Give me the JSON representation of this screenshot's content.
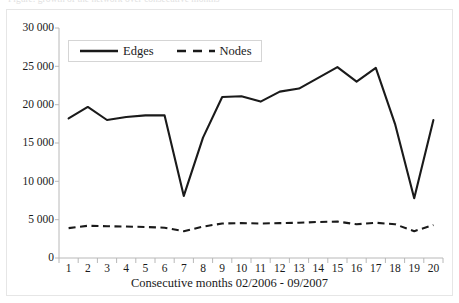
{
  "clipped_caption": "Figure: growth of the network over consecutive months",
  "chart_data": {
    "type": "line",
    "title": "",
    "subtitle": "",
    "xlabel": "Consecutive months 02/2006 - 09/2007",
    "ylabel": "",
    "categories": [
      "1",
      "2",
      "3",
      "4",
      "5",
      "6",
      "7",
      "8",
      "9",
      "10",
      "11",
      "12",
      "13",
      "14",
      "15",
      "16",
      "17",
      "18",
      "19",
      "20"
    ],
    "x": [
      1,
      2,
      3,
      4,
      5,
      6,
      7,
      8,
      9,
      10,
      11,
      12,
      13,
      14,
      15,
      16,
      17,
      18,
      19,
      20
    ],
    "xlim": [
      0.5,
      20.5
    ],
    "ylim": [
      0,
      30000
    ],
    "ytick_values": [
      0,
      5000,
      10000,
      15000,
      20000,
      25000,
      30000
    ],
    "ytick_labels": [
      "0",
      "5 000",
      "10 000",
      "15 000",
      "20 000",
      "25 000",
      "30 000"
    ],
    "xtick_labels": [
      "1",
      "2",
      "3",
      "4",
      "5",
      "6",
      "7",
      "8",
      "9",
      "10",
      "11",
      "12",
      "13",
      "14",
      "15",
      "16",
      "17",
      "18",
      "19",
      "20"
    ],
    "grid": false,
    "legend_position": "upper-left-inside",
    "series": [
      {
        "name": "Edges",
        "style": "solid",
        "color": "#1a1a1a",
        "values": [
          18200,
          19700,
          18000,
          18400,
          18600,
          18600,
          8100,
          15700,
          21000,
          21100,
          20400,
          21700,
          22100,
          23500,
          24900,
          23000,
          24800,
          17500,
          7800,
          18000
        ]
      },
      {
        "name": "Nodes",
        "style": "dashed",
        "color": "#1a1a1a",
        "values": [
          3900,
          4200,
          4150,
          4100,
          4050,
          3950,
          3500,
          4100,
          4500,
          4550,
          4500,
          4550,
          4600,
          4700,
          4750,
          4400,
          4600,
          4400,
          3500,
          4300
        ]
      }
    ]
  },
  "legend": {
    "entries": [
      {
        "label": "Edges",
        "style": "solid"
      },
      {
        "label": "Nodes",
        "style": "dashed"
      }
    ]
  }
}
